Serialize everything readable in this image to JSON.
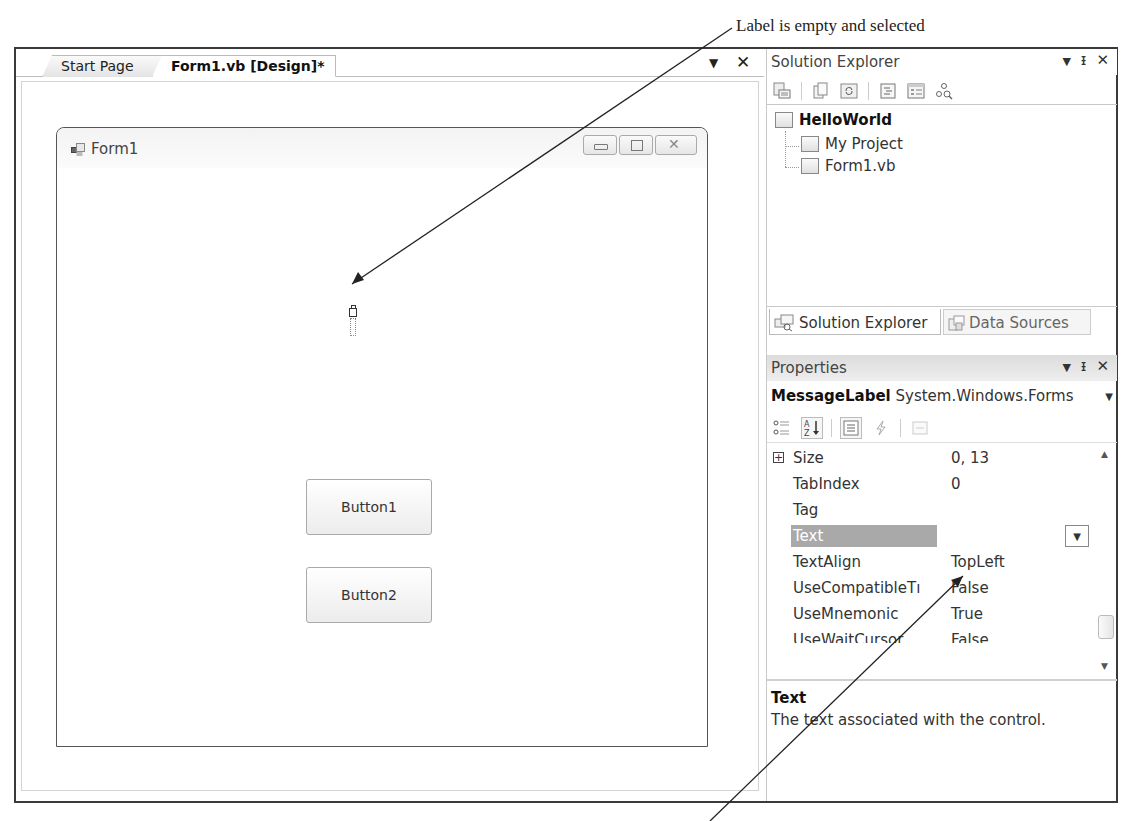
{
  "annotations": {
    "top": "Label is empty and selected"
  },
  "designer": {
    "tabs": [
      {
        "label": "Start Page",
        "active": false
      },
      {
        "label": "Form1.vb [Design]*",
        "active": true
      }
    ],
    "tab_dropdown_icon": "chevron-down-icon",
    "tab_close_icon": "close-icon",
    "form": {
      "title": "Form1",
      "controls": {
        "minimize": "minimize-icon",
        "maximize": "maximize-icon",
        "close": "close-icon"
      },
      "label": {
        "name": "MessageLabel",
        "text": ""
      },
      "buttons": [
        {
          "label": "Button1"
        },
        {
          "label": "Button2"
        }
      ]
    }
  },
  "solution_explorer": {
    "title": "Solution Explorer",
    "toolbar_icons": [
      "properties-icon",
      "show-all-files-icon",
      "refresh-icon",
      "view-code-icon",
      "view-designer-icon",
      "class-diagram-icon"
    ],
    "tree": {
      "root": "HelloWorld",
      "children": [
        "My Project",
        "Form1.vb"
      ]
    },
    "bottom_tabs": [
      {
        "label": "Solution Explorer",
        "active": true
      },
      {
        "label": "Data Sources",
        "active": false
      }
    ]
  },
  "properties": {
    "title": "Properties",
    "object_name": "MessageLabel",
    "object_type": "System.Windows.Forms",
    "toolbar_icons": [
      "categorized-icon",
      "alphabetical-icon",
      "properties-icon",
      "events-icon",
      "property-pages-icon"
    ],
    "rows": [
      {
        "name": "Size",
        "value": "0, 13",
        "expandable": true
      },
      {
        "name": "TabIndex",
        "value": "0"
      },
      {
        "name": "Tag",
        "value": ""
      },
      {
        "name": "Text",
        "value": "",
        "selected": true
      },
      {
        "name": "TextAlign",
        "value": "TopLeft"
      },
      {
        "name": "UseCompatibleTextRendering",
        "display_name": "UseCompatibleTı",
        "value": "False"
      },
      {
        "name": "UseMnemonic",
        "value": "True"
      },
      {
        "name": "UseWaitCursor",
        "value": "False"
      }
    ],
    "description": {
      "title": "Text",
      "body": "The text associated with the control."
    }
  },
  "colors": {
    "selected_row_bg": "#a9a9a9",
    "frame_border": "#3a3a3a"
  }
}
